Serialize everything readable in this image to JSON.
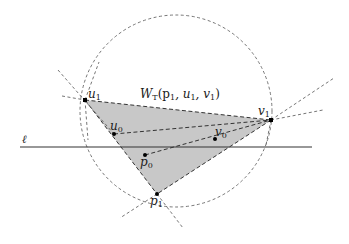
{
  "diagram": {
    "title_label": {
      "main": "W",
      "sub": "T",
      "rest": "(p",
      "sub2": "1",
      "tail": ", u",
      "sub3": "1",
      "tail2": ", v",
      "sub4": "1",
      "close": ")"
    },
    "line_label": "ℓ",
    "points": {
      "u1": {
        "name": "u",
        "sub": "1",
        "x": 85,
        "y": 100
      },
      "v1": {
        "name": "v",
        "sub": "1",
        "x": 271,
        "y": 120
      },
      "u0": {
        "name": "u",
        "sub": "0",
        "x": 114,
        "y": 134
      },
      "v0": {
        "name": "v",
        "sub": "0",
        "x": 215,
        "y": 139
      },
      "p0": {
        "name": "p",
        "sub": "0",
        "x": 145,
        "y": 155
      },
      "p1": {
        "name": "p",
        "sub": "1",
        "x": 157,
        "y": 194
      }
    },
    "colors": {
      "fill": "#c8c8c8",
      "stroke": "#333333",
      "dashed": "#555555"
    }
  }
}
